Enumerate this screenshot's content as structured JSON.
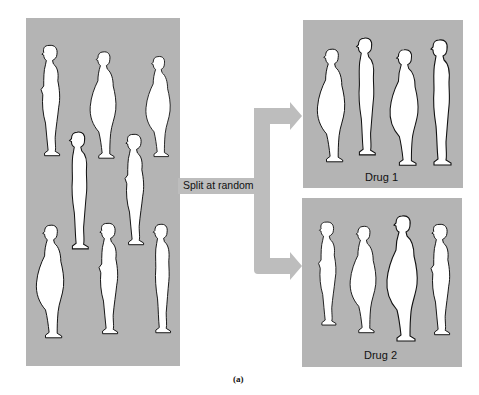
{
  "diagram": {
    "type": "random-assignment illustration",
    "source_group": {
      "label": "",
      "figure_count": 9
    },
    "connector": {
      "label": "Split at random"
    },
    "groups": [
      {
        "label": "Drug 1",
        "figure_count": 4
      },
      {
        "label": "Drug 2",
        "figure_count": 4
      }
    ],
    "caption": "(a)",
    "colors": {
      "panel": "#b4b4b4",
      "connector": "#bdbdbd",
      "figure_fill": "#ffffff",
      "figure_outline": "#111111"
    }
  }
}
